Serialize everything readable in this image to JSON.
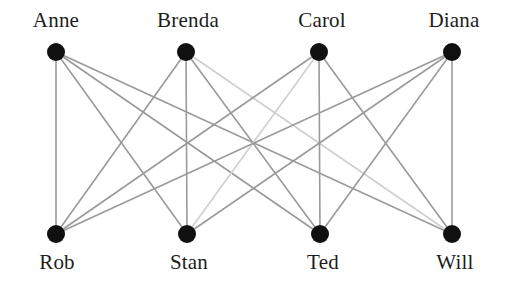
{
  "figure": {
    "name": "bipartite-matching-graph",
    "background_color": "#ffffff",
    "width": 507,
    "height": 288
  },
  "graph": {
    "type": "complete-bipartite",
    "notation": "K(4,4)",
    "node_color": "#101010",
    "node_radius": 9,
    "edge_color_dark": "#9a9a9a",
    "edge_color_light": "#cfcfcf",
    "edge_width": 1.6,
    "label_color": "#1d1d1d",
    "top_row": [
      {
        "id": "anne",
        "label": "Anne",
        "x": 56,
        "y": 52,
        "label_x": 56,
        "label_y": 8
      },
      {
        "id": "brenda",
        "label": "Brenda",
        "x": 186,
        "y": 52,
        "label_x": 188,
        "label_y": 8
      },
      {
        "id": "carol",
        "label": "Carol",
        "x": 319,
        "y": 52,
        "label_x": 322,
        "label_y": 8
      },
      {
        "id": "diana",
        "label": "Diana",
        "x": 452,
        "y": 52,
        "label_x": 454,
        "label_y": 8
      }
    ],
    "bottom_row": [
      {
        "id": "rob",
        "label": "Rob",
        "x": 56,
        "y": 234,
        "label_x": 57,
        "label_y": 250
      },
      {
        "id": "stan",
        "label": "Stan",
        "x": 187,
        "y": 234,
        "label_x": 189,
        "label_y": 250
      },
      {
        "id": "ted",
        "label": "Ted",
        "x": 320,
        "y": 234,
        "label_x": 323,
        "label_y": 250
      },
      {
        "id": "will",
        "label": "Will",
        "x": 452,
        "y": 234,
        "label_x": 455,
        "label_y": 250
      }
    ],
    "edges": [
      {
        "from": "anne",
        "to": "rob",
        "shade": "dark"
      },
      {
        "from": "anne",
        "to": "stan",
        "shade": "dark"
      },
      {
        "from": "anne",
        "to": "ted",
        "shade": "dark"
      },
      {
        "from": "anne",
        "to": "will",
        "shade": "dark"
      },
      {
        "from": "brenda",
        "to": "rob",
        "shade": "dark"
      },
      {
        "from": "brenda",
        "to": "stan",
        "shade": "dark"
      },
      {
        "from": "brenda",
        "to": "ted",
        "shade": "dark"
      },
      {
        "from": "brenda",
        "to": "will",
        "shade": "light"
      },
      {
        "from": "carol",
        "to": "rob",
        "shade": "dark"
      },
      {
        "from": "carol",
        "to": "stan",
        "shade": "light"
      },
      {
        "from": "carol",
        "to": "ted",
        "shade": "dark"
      },
      {
        "from": "carol",
        "to": "will",
        "shade": "dark"
      },
      {
        "from": "diana",
        "to": "rob",
        "shade": "dark"
      },
      {
        "from": "diana",
        "to": "stan",
        "shade": "dark"
      },
      {
        "from": "diana",
        "to": "ted",
        "shade": "dark"
      },
      {
        "from": "diana",
        "to": "will",
        "shade": "dark"
      }
    ]
  }
}
